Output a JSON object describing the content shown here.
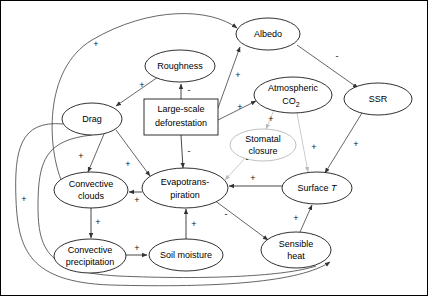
{
  "diagram": {
    "type": "causal-loop-diagram",
    "width": 428,
    "height": 296,
    "colors": {
      "node_stroke": "#1a1a1a",
      "faint_node_stroke": "#b9b9b9",
      "edge_stroke": "#4a4a4a",
      "background": "#ffffff",
      "text": "#000000"
    },
    "nodes": [
      {
        "id": "deforestation",
        "label_lines": [
          "Large-scale",
          "deforestation"
        ],
        "shape": "rect",
        "cx": 181,
        "cy": 117,
        "rx": 37,
        "ry": 18
      },
      {
        "id": "roughness",
        "label_lines": [
          "Roughness"
        ],
        "shape": "ellipse",
        "cx": 180,
        "cy": 66,
        "rx": 35,
        "ry": 16
      },
      {
        "id": "drag",
        "label_lines": [
          "Drag"
        ],
        "shape": "ellipse",
        "cx": 92,
        "cy": 119,
        "rx": 30,
        "ry": 16
      },
      {
        "id": "albedo",
        "label_lines": [
          "Albedo"
        ],
        "shape": "ellipse",
        "cx": 268,
        "cy": 34,
        "rx": 32,
        "ry": 16
      },
      {
        "id": "co2",
        "label_lines": [
          "Atmospheric",
          "CO2"
        ],
        "shape": "ellipse",
        "cx": 293,
        "cy": 95,
        "rx": 39,
        "ry": 18
      },
      {
        "id": "ssr",
        "label_lines": [
          "SSR"
        ],
        "shape": "ellipse",
        "cx": 378,
        "cy": 99,
        "rx": 34,
        "ry": 16
      },
      {
        "id": "stomatal",
        "label_lines": [
          "Stomatal",
          "closure"
        ],
        "shape": "ellipse",
        "cx": 263,
        "cy": 145,
        "rx": 33,
        "ry": 16
      },
      {
        "id": "evapo",
        "label_lines": [
          "Evapotrans-",
          "piration"
        ],
        "shape": "ellipse",
        "cx": 185,
        "cy": 188,
        "rx": 43,
        "ry": 20
      },
      {
        "id": "surfacet",
        "label_lines": [
          "Surface T"
        ],
        "shape": "ellipse",
        "cx": 317,
        "cy": 188,
        "rx": 35,
        "ry": 16
      },
      {
        "id": "convclouds",
        "label_lines": [
          "Convective",
          "clouds"
        ],
        "shape": "ellipse",
        "cx": 91,
        "cy": 190,
        "rx": 37,
        "ry": 18
      },
      {
        "id": "convprecip",
        "label_lines": [
          "Convective",
          "precipitation"
        ],
        "shape": "ellipse",
        "cx": 90,
        "cy": 256,
        "rx": 36,
        "ry": 17
      },
      {
        "id": "soilmoist",
        "label_lines": [
          "Soil moisture"
        ],
        "shape": "ellipse",
        "cx": 186,
        "cy": 255,
        "rx": 37,
        "ry": 16
      },
      {
        "id": "sensible",
        "label_lines": [
          "Sensible",
          "heat"
        ],
        "shape": "ellipse",
        "cx": 296,
        "cy": 250,
        "rx": 35,
        "ry": 18
      }
    ],
    "edges": [
      {
        "from": "deforestation",
        "to": "roughness",
        "sign": "-"
      },
      {
        "from": "deforestation",
        "to": "albedo",
        "sign": "+"
      },
      {
        "from": "deforestation",
        "to": "co2",
        "sign": "+"
      },
      {
        "from": "deforestation",
        "to": "evapo",
        "sign": "-"
      },
      {
        "from": "roughness",
        "to": "drag",
        "sign": "+"
      },
      {
        "from": "drag",
        "to": "convclouds",
        "sign": "+"
      },
      {
        "from": "drag",
        "to": "evapo",
        "sign": "+"
      },
      {
        "from": "albedo",
        "to": "ssr",
        "sign": "-"
      },
      {
        "from": "co2",
        "to": "surfacet",
        "sign": "+"
      },
      {
        "from": "co2",
        "to": "stomatal",
        "sign": "+"
      },
      {
        "from": "stomatal",
        "to": "evapo",
        "sign": "-"
      },
      {
        "from": "ssr",
        "to": "surfacet",
        "sign": "+"
      },
      {
        "from": "evapo",
        "to": "convclouds",
        "sign": "+"
      },
      {
        "from": "evapo",
        "to": "sensible",
        "sign": "-"
      },
      {
        "from": "surfacet",
        "to": "evapo",
        "sign": "+"
      },
      {
        "from": "sensible",
        "to": "surfacet",
        "sign": "+"
      },
      {
        "from": "convclouds",
        "to": "convprecip",
        "sign": "+"
      },
      {
        "from": "convprecip",
        "to": "soilmoist",
        "sign": "+"
      },
      {
        "from": "soilmoist",
        "to": "evapo",
        "sign": "+"
      },
      {
        "from": "convclouds",
        "to": "albedo",
        "sign": "+"
      },
      {
        "from": "evapo",
        "to": "sensible",
        "sign": "+"
      }
    ],
    "sign_labels": {
      "defo_roughness": "-",
      "defo_evapo": "-",
      "defo_albedo": "+",
      "defo_co2": "+",
      "rough_drag": "+",
      "drag_clouds": "+",
      "drag_evapo": "+",
      "albedo_ssr": "-",
      "co2_surfacet": "+",
      "co2_stomatal": "+",
      "stomatal_evapo": "-",
      "ssr_surfacet": "+",
      "evapo_clouds": "+",
      "evapo_sensible": "-",
      "surfacet_evapo": "+",
      "sensible_surfacet": "+",
      "clouds_precip": "+",
      "precip_soil": "+",
      "soil_evapo": "+",
      "loop_outer_albedo": "+",
      "loop_left_long": "+",
      "loop_bottom": "+"
    },
    "labels": {
      "roughness": "Roughness",
      "drag": "Drag",
      "albedo": "Albedo",
      "ssr": "SSR",
      "atmospheric": "Atmospheric",
      "co2": "CO",
      "co2_sub": "2",
      "deforestation_l1": "Large-scale",
      "deforestation_l2": "deforestation",
      "stomatal_l1": "Stomatal",
      "stomatal_l2": "closure",
      "evapo_l1": "Evapotrans-",
      "evapo_l2": "piration",
      "surfacet_pre": "Surface ",
      "surfacet_var": "T",
      "convclouds_l1": "Convective",
      "convclouds_l2": "clouds",
      "convprecip_l1": "Convective",
      "convprecip_l2": "precipitation",
      "soilmoisture": "Soil moisture",
      "sensible_l1": "Sensible",
      "sensible_l2": "heat"
    }
  }
}
